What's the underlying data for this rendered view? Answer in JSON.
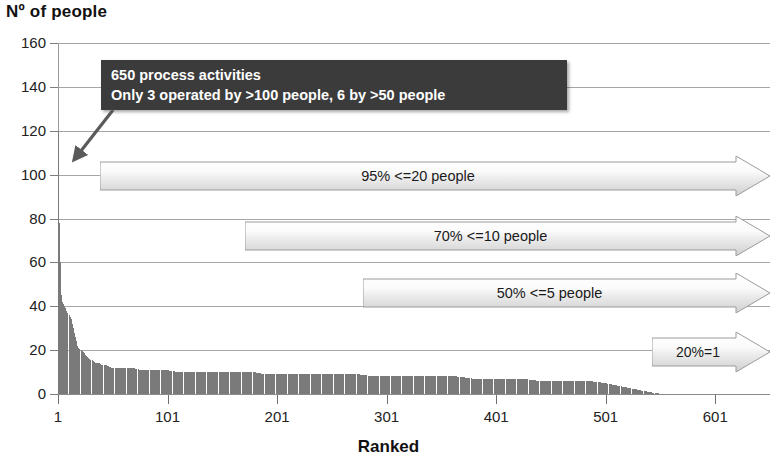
{
  "chart_data": {
    "type": "bar",
    "title": "Nº of people",
    "xlabel": "Ranked",
    "ylabel": "Nº of people",
    "xlim": [
      1,
      651
    ],
    "ylim": [
      0,
      160
    ],
    "grid": true,
    "legend": "none",
    "y_ticks": [
      160,
      140,
      120,
      100,
      80,
      60,
      40,
      20,
      0
    ],
    "x_ticks": [
      1,
      101,
      201,
      301,
      401,
      501,
      601
    ],
    "series": [
      {
        "name": "Nº of people per activity",
        "color": "#7a7a7a",
        "x": [
          1,
          2,
          3,
          4,
          5,
          6,
          7,
          8,
          9,
          10,
          11,
          12,
          13,
          14,
          15,
          16,
          17,
          18,
          19,
          20,
          22,
          24,
          26,
          28,
          30,
          33,
          36,
          39,
          42,
          45,
          50,
          55,
          60,
          65,
          70,
          75,
          80,
          85,
          90,
          95,
          100,
          110,
          120,
          130,
          140,
          150,
          160,
          170,
          180,
          190,
          200,
          215,
          230,
          245,
          260,
          275,
          290,
          305,
          320,
          335,
          350,
          365,
          380,
          395,
          410,
          425,
          440,
          455,
          470,
          485,
          500,
          510,
          520,
          530,
          540,
          550,
          600,
          650
        ],
        "values": [
          120,
          78,
          60,
          45,
          42,
          41,
          40,
          39,
          38,
          37,
          36,
          35,
          34,
          32,
          30,
          28,
          26,
          24,
          22,
          21,
          20,
          19,
          18,
          17,
          16,
          15,
          14,
          14,
          13,
          13,
          12,
          12,
          12,
          12,
          12,
          11,
          11,
          11,
          11,
          11,
          11,
          10,
          10,
          10,
          10,
          10,
          10,
          10,
          10,
          9,
          9,
          9,
          9,
          9,
          9,
          9,
          8,
          8,
          8,
          8,
          8,
          8,
          7,
          7,
          7,
          7,
          6,
          6,
          6,
          6,
          5,
          4,
          3,
          2,
          1,
          0,
          0,
          0
        ]
      }
    ],
    "annotations": {
      "callout": {
        "line1": "650 process activities",
        "line2": "Only 3 operated by >100 people, 6 by >50 people",
        "background": "#3b3b3b",
        "text_color": "#ffffff"
      },
      "banners": [
        {
          "label": "95%  <=20 people",
          "y_value": 100
        },
        {
          "label": "70%  <=10 people",
          "y_value": 70
        },
        {
          "label": "50%  <=5 people",
          "y_value": 45
        },
        {
          "label": "20%=1",
          "y_value": 20
        }
      ]
    }
  },
  "colors": {
    "bar": "#7a7a7a",
    "grid": "#a6a6a6",
    "axis": "#8a8a8a",
    "callout_bg": "#3b3b3b",
    "banner_fill_light": "#ffffff",
    "banner_fill_dark": "#d7d7d7",
    "banner_stroke": "#9b9b9b"
  }
}
